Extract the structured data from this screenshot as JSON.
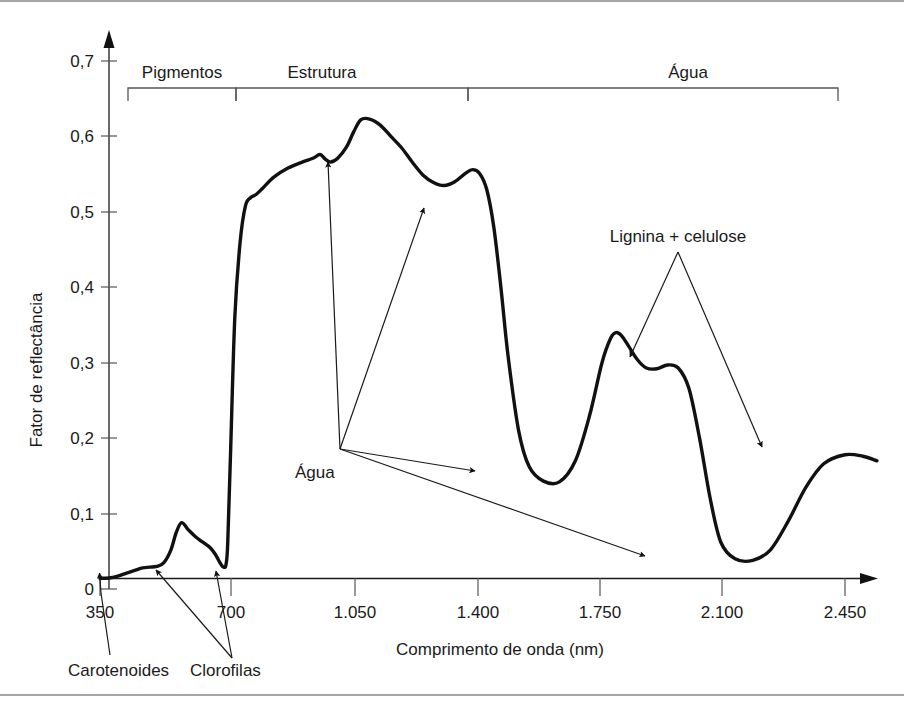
{
  "chart_data": {
    "type": "line",
    "title": "",
    "xlabel": "Comprimento de onda (nm)",
    "ylabel": "Fator de reflectância",
    "xlim": [
      350,
      2540
    ],
    "ylim": [
      0,
      0.73
    ],
    "grid": false,
    "legend": "none",
    "xticks": [
      "350",
      "700",
      "1.050",
      "1.400",
      "1.750",
      "2.100",
      "2.450"
    ],
    "xtick_values": [
      350,
      700,
      1050,
      1400,
      1750,
      2100,
      2450
    ],
    "yticks": [
      "0",
      "0,1",
      "0,2",
      "0,3",
      "0,4",
      "0,5",
      "0,6",
      "0,7"
    ],
    "ytick_values": [
      0,
      0.1,
      0.2,
      0.3,
      0.4,
      0.5,
      0.6,
      0.7
    ],
    "series": [
      {
        "name": "Reflectância da vegetação verde",
        "x": [
          350,
          380,
          400,
          425,
          450,
          470,
          490,
          510,
          530,
          550,
          565,
          580,
          600,
          620,
          640,
          660,
          675,
          688,
          695,
          700,
          705,
          710,
          718,
          730,
          745,
          760,
          775,
          790,
          810,
          840,
          880,
          920,
          950,
          970,
          985,
          1000,
          1020,
          1045,
          1065,
          1085,
          1110,
          1140,
          1170,
          1200,
          1230,
          1260,
          1290,
          1320,
          1350,
          1380,
          1400,
          1420,
          1440,
          1460,
          1480,
          1500,
          1530,
          1560,
          1600,
          1645,
          1690,
          1730,
          1765,
          1790,
          1805,
          1820,
          1840,
          1865,
          1890,
          1920,
          1950,
          1980,
          2010,
          2040,
          2070,
          2100,
          2140,
          2190,
          2240,
          2290,
          2340,
          2390,
          2450,
          2500,
          2540
        ],
        "y": [
          0.014,
          0.015,
          0.017,
          0.021,
          0.025,
          0.028,
          0.029,
          0.03,
          0.035,
          0.052,
          0.075,
          0.088,
          0.078,
          0.069,
          0.062,
          0.055,
          0.046,
          0.035,
          0.03,
          0.029,
          0.032,
          0.06,
          0.18,
          0.36,
          0.46,
          0.508,
          0.519,
          0.523,
          0.532,
          0.546,
          0.558,
          0.566,
          0.571,
          0.576,
          0.57,
          0.566,
          0.571,
          0.586,
          0.606,
          0.622,
          0.623,
          0.615,
          0.6,
          0.585,
          0.566,
          0.549,
          0.539,
          0.535,
          0.54,
          0.551,
          0.556,
          0.551,
          0.53,
          0.48,
          0.4,
          0.31,
          0.21,
          0.162,
          0.143,
          0.142,
          0.17,
          0.23,
          0.3,
          0.333,
          0.34,
          0.336,
          0.322,
          0.304,
          0.293,
          0.292,
          0.297,
          0.293,
          0.266,
          0.2,
          0.12,
          0.062,
          0.04,
          0.038,
          0.052,
          0.09,
          0.135,
          0.166,
          0.178,
          0.176,
          0.17
        ],
        "color": "#111111"
      }
    ],
    "feature_points": {
      "green_peak": {
        "wavelength": 580,
        "reflectance": 0.088
      },
      "nir_plateau_bump": {
        "wavelength": 970,
        "reflectance": 0.576
      },
      "nir_max": {
        "wavelength": 1085,
        "reflectance": 0.623
      },
      "nir_second_peak": {
        "wavelength": 1400,
        "reflectance": 0.556
      },
      "water_dip_1450": {
        "wavelength": 1645,
        "reflectance": 0.142
      },
      "swir_peak_1650": {
        "wavelength": 1805,
        "reflectance": 0.34
      },
      "lignin_shoulder": {
        "wavelength": 1950,
        "reflectance": 0.297
      },
      "water_dip_1940": {
        "wavelength": 2140,
        "reflectance": 0.038
      },
      "swir_peak_2200": {
        "wavelength": 2290,
        "reflectance": 0.178
      },
      "tail_end": {
        "wavelength": 2540,
        "reflectance": 0.17
      }
    },
    "bands": [
      {
        "label": "Pigmentos",
        "start": 350,
        "end": 660
      },
      {
        "label": "Estrutura",
        "start": 660,
        "end": 1320
      },
      {
        "label": "Água",
        "start": 1320,
        "end": 2400
      }
    ],
    "annotations": [
      {
        "label": "Carotenoides",
        "targets": 1
      },
      {
        "label": "Clorofilas",
        "targets": 2
      },
      {
        "label": "Água",
        "targets": 4
      },
      {
        "label": "Lignina + celulose",
        "targets": 2
      }
    ]
  },
  "axes": {
    "ylabel": "Fator de reflectância",
    "xlabel": "Comprimento de onda (nm)",
    "ytick_labels": [
      "0,7",
      "0,6",
      "0,5",
      "0,4",
      "0,3",
      "0,2",
      "0,1",
      "0"
    ],
    "xtick_labels": [
      "350",
      "700",
      "1.050",
      "1.400",
      "1.750",
      "2.100",
      "2.450"
    ]
  },
  "bands": {
    "pigmentos": "Pigmentos",
    "estrutura": "Estrutura",
    "agua": "Água"
  },
  "annotations": {
    "carotenoides": "Carotenoides",
    "clorofilas": "Clorofilas",
    "agua": "Água",
    "lignina": "Lignina + celulose"
  },
  "colors": {
    "curve": "#111111",
    "axis": "#1a1a1a",
    "bracket": "#555555",
    "frame": "#8a8a8a",
    "background": "#ffffff"
  }
}
